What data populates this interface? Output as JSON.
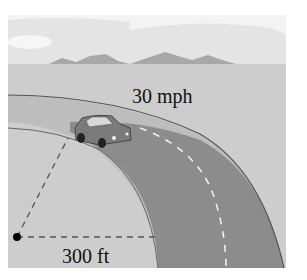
{
  "figure": {
    "speed_label": "30 mph",
    "radius_label": "300 ft",
    "elements": [
      "sky",
      "mountains",
      "ground",
      "curved-road",
      "car",
      "center-point",
      "radius-lines"
    ]
  },
  "colors": {
    "sky": "#f2f2f2",
    "cloud": "#e6e6e6",
    "mountains": "#a9a9a9",
    "ground": "#cfcfcf",
    "road": "#8d8d8d",
    "road_edge": "#555555",
    "lane_marking": "#f0f0f0",
    "dashed_line": "#555555",
    "center_dot": "#000000"
  }
}
